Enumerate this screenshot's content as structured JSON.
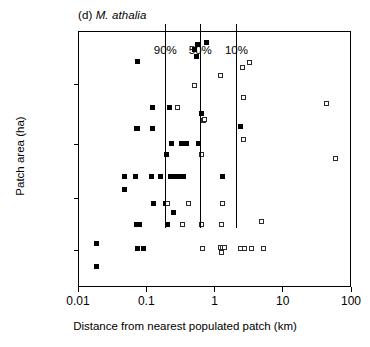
{
  "panel": {
    "label": "(d)",
    "species": "M. athalia"
  },
  "chart_data": {
    "type": "scatter",
    "title": "(d) M. athalia",
    "xlabel": "Distance from nearest populated patch (km)",
    "ylabel": "Patch area (ha)",
    "xscale": "log",
    "yscale": "log",
    "xlim": [
      0.01,
      100
    ],
    "xtick_labels": [
      "0.01",
      "0.1",
      "1",
      "10",
      "100"
    ],
    "xtick_values": [
      0.01,
      0.1,
      1,
      10,
      100
    ],
    "ytick_labels": [
      "",
      "",
      "",
      ""
    ],
    "ylabel_note": "y-axis ticks unlabelled",
    "grid": false,
    "legend": "none",
    "annotations": [
      {
        "name": "90%",
        "type": "vertical-line",
        "x": 0.19
      },
      {
        "name": "50%",
        "type": "vertical-line",
        "x": 0.62
      },
      {
        "name": "10%",
        "type": "vertical-line",
        "x": 2.1
      }
    ],
    "series": [
      {
        "name": "occupied patch",
        "marker": "filled-square",
        "color": "#000000",
        "points": [
          [
            0.018,
            0.175
          ],
          [
            0.018,
            0.085
          ],
          [
            0.047,
            0.435
          ],
          [
            0.047,
            0.385
          ],
          [
            0.068,
            0.435
          ],
          [
            0.073,
            0.885
          ],
          [
            0.07,
            0.25
          ],
          [
            0.078,
            0.25
          ],
          [
            0.07,
            0.625
          ],
          [
            0.072,
            0.625
          ],
          [
            0.073,
            0.155
          ],
          [
            0.088,
            0.155
          ],
          [
            0.115,
            0.435
          ],
          [
            0.118,
            0.705
          ],
          [
            0.118,
            0.625
          ],
          [
            0.122,
            0.33
          ],
          [
            0.155,
            0.435
          ],
          [
            0.185,
            0.33
          ],
          [
            0.192,
            0.52
          ],
          [
            0.195,
            0.25
          ],
          [
            0.215,
            0.705
          ],
          [
            0.218,
            0.435
          ],
          [
            0.228,
            0.565
          ],
          [
            0.245,
            0.295
          ],
          [
            0.262,
            0.435
          ],
          [
            0.275,
            0.705
          ],
          [
            0.3,
            0.435
          ],
          [
            0.315,
            0.565
          ],
          [
            0.34,
            0.565
          ],
          [
            0.345,
            0.435
          ],
          [
            0.375,
            0.565
          ],
          [
            0.5,
            0.93
          ],
          [
            0.52,
            0.905
          ],
          [
            0.545,
            0.95
          ],
          [
            0.56,
            0.565
          ],
          [
            0.62,
            0.68
          ],
          [
            0.74,
            0.96
          ],
          [
            1.25,
            0.435
          ],
          [
            2.35,
            0.63
          ]
        ]
      },
      {
        "name": "empty patch",
        "marker": "open-square",
        "color": "#ffffff",
        "points": [
          [
            0.195,
            0.33
          ],
          [
            0.28,
            0.705
          ],
          [
            0.33,
            0.25
          ],
          [
            0.4,
            0.33
          ],
          [
            0.5,
            0.79
          ],
          [
            0.62,
            0.52
          ],
          [
            0.63,
            0.25
          ],
          [
            0.645,
            0.155
          ],
          [
            0.66,
            0.655
          ],
          [
            0.68,
            0.66
          ],
          [
            1.2,
            0.83
          ],
          [
            1.25,
            0.33
          ],
          [
            1.22,
            0.25
          ],
          [
            1.2,
            0.16
          ],
          [
            1.28,
            0.16
          ],
          [
            1.36,
            0.16
          ],
          [
            1.22,
            0.14
          ],
          [
            2.3,
            0.155
          ],
          [
            2.45,
            0.86
          ],
          [
            2.55,
            0.745
          ],
          [
            2.55,
            0.58
          ],
          [
            2.7,
            0.155
          ],
          [
            3.1,
            0.88
          ],
          [
            3.4,
            0.155
          ],
          [
            4.7,
            0.26
          ],
          [
            5.1,
            0.155
          ],
          [
            42.0,
            0.72
          ],
          [
            58.0,
            0.505
          ]
        ]
      }
    ]
  }
}
